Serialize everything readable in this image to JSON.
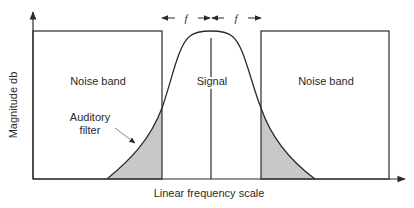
{
  "diagram": {
    "type": "auditory-filter-masking",
    "y_axis_label": "Magnitude db",
    "x_axis_label": "Linear frequency scale",
    "labels": {
      "noise_left": "Noise band",
      "noise_right": "Noise band",
      "signal": "Signal",
      "filter_line1": "Auditory",
      "filter_line2": "filter",
      "bandwidth_left": "f",
      "bandwidth_right": "f"
    },
    "colors": {
      "stroke": "#2a2a2a",
      "shading": "#c8c8c8",
      "background": "#ffffff"
    }
  }
}
